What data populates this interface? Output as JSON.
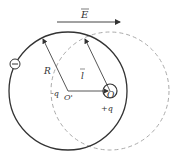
{
  "diagram": {
    "field_label": "E",
    "radius_label": "R",
    "displacement_label": "l",
    "negative_charge_label": "-q",
    "positive_charge_label": "+q",
    "center_shifted_label": "O'",
    "center_label": "O",
    "electron_symbol": "−",
    "colors": {
      "solid_circle": "#333333",
      "dashed_circle": "#aaaaaa",
      "arrows": "#444444"
    }
  }
}
